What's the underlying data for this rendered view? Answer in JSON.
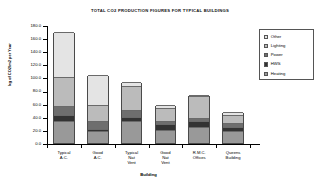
{
  "chart_data": {
    "type": "bar",
    "stacked": true,
    "title": "TOTAL CO2 PRODUCTION FIGURES FOR TYPICAL BUILDINGS",
    "xlabel": "Building",
    "ylabel": "kg of CO2/m2 per Year",
    "ylim": [
      0.0,
      180.0
    ],
    "ytick_labels": [
      "180.0",
      "160.0",
      "140.0",
      "120.0",
      "100.0",
      "80.0",
      "60.0",
      "40.0",
      "20.0",
      "0.0"
    ],
    "ytick_values": [
      180,
      160,
      140,
      120,
      100,
      80,
      60,
      40,
      20,
      0
    ],
    "grid": false,
    "legend_position": "right",
    "categories": [
      "Typical\nA.C.",
      "Good\nA.C.",
      "Typical\nNat\nVent",
      "Good\nNat\nVent",
      "R.M.C.\nOffices",
      "Queens\nBuilding"
    ],
    "series": [
      {
        "name": "Heating",
        "color": "#999999",
        "values": [
          33,
          18,
          33,
          20,
          24,
          19
        ]
      },
      {
        "name": "HWS",
        "color": "#333333",
        "values": [
          10,
          4,
          7,
          9,
          9,
          5
        ]
      },
      {
        "name": "Power",
        "color": "#6e6e6e",
        "values": [
          14,
          11,
          10,
          5,
          5,
          6
        ]
      },
      {
        "name": "Lighting",
        "color": "#bbbbbb",
        "values": [
          43,
          25,
          37,
          20,
          33,
          13
        ]
      },
      {
        "name": "Other",
        "color": "#e4e4e4",
        "values": [
          70,
          46,
          6,
          4,
          2,
          4
        ]
      }
    ],
    "totals": [
      170,
      104,
      93,
      58,
      73,
      47
    ]
  },
  "legend": {
    "entries": [
      {
        "label": "Other",
        "color": "#e4e4e4"
      },
      {
        "label": "Lighting",
        "color": "#bbbbbb"
      },
      {
        "label": "Power",
        "color": "#6e6e6e"
      },
      {
        "label": "HWS",
        "color": "#333333"
      },
      {
        "label": "Heating",
        "color": "#999999"
      }
    ]
  }
}
